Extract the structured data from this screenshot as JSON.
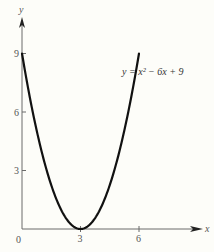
{
  "chart_data": {
    "type": "line",
    "title": "",
    "xlabel": "x",
    "ylabel": "y",
    "equation_label": "y = x² − 6x + 9",
    "x_ticks": [
      "3",
      "6"
    ],
    "y_ticks": [
      "3",
      "6",
      "9"
    ],
    "origin_label": "0",
    "xlim": [
      0,
      9.3
    ],
    "ylim": [
      0,
      10.5
    ],
    "grid": false,
    "series": [
      {
        "name": "y = x^2 - 6x + 9",
        "x": [
          0,
          0.5,
          1,
          1.5,
          2,
          2.5,
          3,
          3.5,
          4,
          4.5,
          5,
          5.5,
          6
        ],
        "y": [
          9,
          6.25,
          4,
          2.25,
          1,
          0.25,
          0,
          0.25,
          1,
          2.25,
          4,
          6.25,
          9
        ]
      }
    ],
    "colors": {
      "curve": "#111111",
      "axis": "#6a6a6a",
      "background": "#fdfdf9"
    }
  }
}
